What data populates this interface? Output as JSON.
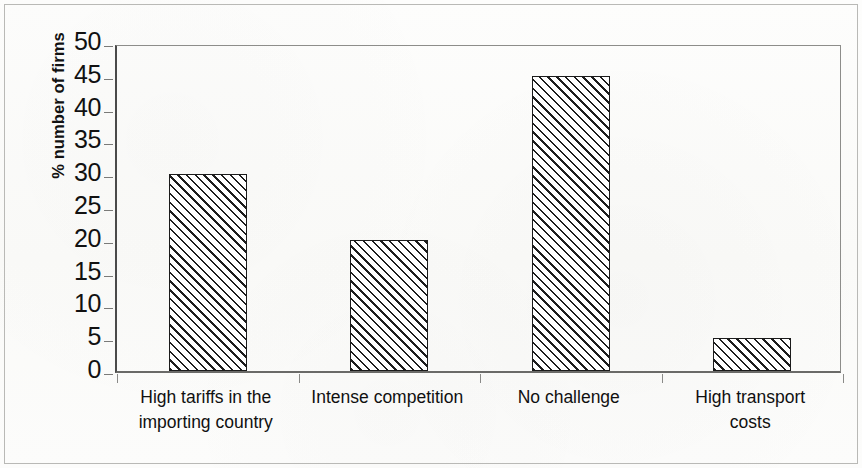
{
  "chart_data": {
    "type": "bar",
    "title": "",
    "subtitle": "",
    "xlabel": "",
    "ylabel": "% number of firms",
    "categories": [
      "High tariffs in the importing country",
      "Intense competition",
      "No challenge",
      "High transport costs"
    ],
    "category_lines": [
      [
        "High tariffs in the",
        "importing country"
      ],
      [
        "Intense competition",
        ""
      ],
      [
        "No challenge",
        ""
      ],
      [
        "High transport",
        "costs"
      ]
    ],
    "values": [
      30,
      20,
      45,
      5
    ],
    "ylim": [
      0,
      50
    ],
    "ytick_step": 5,
    "yticks": [
      50,
      45,
      40,
      35,
      30,
      25,
      20,
      15,
      10,
      5,
      0
    ],
    "grid": false,
    "legend": null,
    "legend_position": "none",
    "bar_fill": "diagonal-hatch",
    "bar_outline_color": "#1b1b1b",
    "axis_color": "#4a4a4a",
    "background_color": "#fcfcfb"
  },
  "figure": {
    "frame_visible": true,
    "frame_color": "#b9b9b6"
  }
}
